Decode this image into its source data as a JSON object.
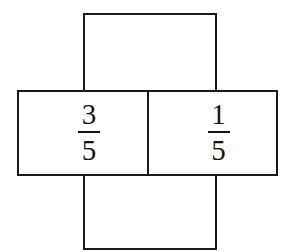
{
  "figure": {
    "type": "fraction-cross-diagram",
    "background_color": "#ffffff",
    "line_color": "#1a1a1a",
    "text_color": "#141414",
    "cells": [
      {
        "name": "top",
        "label": "",
        "numerator": "",
        "denominator": "",
        "empty": true
      },
      {
        "name": "left",
        "label": "3/5",
        "numerator": "3",
        "denominator": "5",
        "empty": false
      },
      {
        "name": "right",
        "label": "1/5",
        "numerator": "1",
        "denominator": "5",
        "empty": false
      },
      {
        "name": "bottom",
        "label": "",
        "numerator": "",
        "denominator": "",
        "empty": true
      }
    ]
  }
}
